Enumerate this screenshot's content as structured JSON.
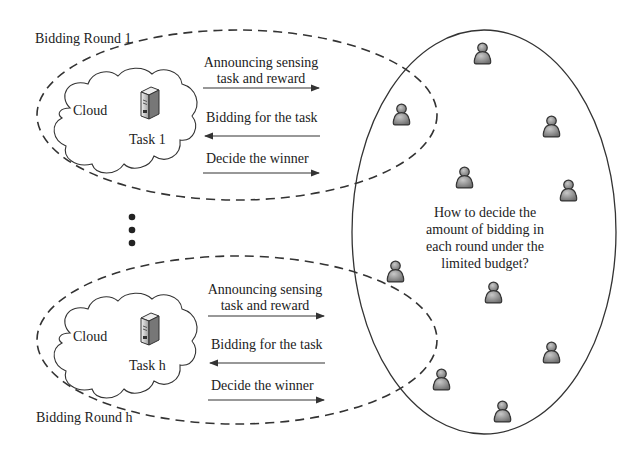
{
  "rounds": [
    {
      "label": "Bidding Round 1",
      "cloud_label": "Cloud",
      "task_label": "Task 1",
      "messages": [
        {
          "text_line1": "Announcing sensing",
          "text_line2": "task and reward",
          "direction": "right"
        },
        {
          "text_line1": "Bidding for the task",
          "direction": "left"
        },
        {
          "text_line1": "Decide the winner",
          "direction": "right"
        }
      ]
    },
    {
      "label": "Bidding Round h",
      "cloud_label": "Cloud",
      "task_label": "Task h",
      "messages": [
        {
          "text_line1": "Announcing sensing",
          "text_line2": "task and reward",
          "direction": "right"
        },
        {
          "text_line1": "Bidding for the task",
          "direction": "left"
        },
        {
          "text_line1": "Decide the winner",
          "direction": "right"
        }
      ]
    }
  ],
  "ellipsis": "vertical-dots",
  "crowd": {
    "question_lines": [
      "How to decide the",
      "amount of bidding in",
      "each round under the",
      "limited budget?"
    ],
    "user_count": 10
  },
  "icons": {
    "server": "server-icon",
    "user": "person-icon",
    "cloud": "cloud-shape"
  },
  "colors": {
    "stroke": "#333333",
    "person_fill": "#8a8a8a",
    "server_fill": "#d9d9d9"
  }
}
